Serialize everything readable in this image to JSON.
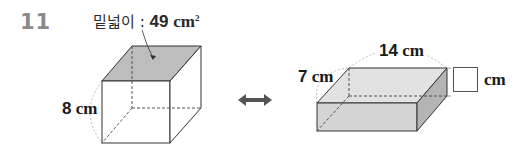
{
  "question": {
    "number": "11"
  },
  "left_figure": {
    "shape": "cube",
    "base_area_label": "밑넓이",
    "separator": " : ",
    "base_area_value": "49",
    "base_area_unit": "cm",
    "base_area_exponent": "2",
    "height_label": "8 cm",
    "height_value": "8",
    "height_unit": "cm",
    "top_face_color": "#bdbdbd"
  },
  "connector": {
    "icon": "double-arrow-icon",
    "color": "#555555"
  },
  "right_figure": {
    "shape": "rectangular-prism",
    "depth_value": "7",
    "width_value": "14",
    "unit": "cm",
    "height_answer": "",
    "answer_unit": "cm",
    "front_face_color": "#d4d4d4",
    "top_face_color": "#e2e2e2",
    "side_face_color": "#b4b4b4"
  }
}
